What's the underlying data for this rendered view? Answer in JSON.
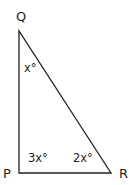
{
  "diagram": {
    "type": "right-triangle",
    "vertices": [
      {
        "name": "Q",
        "x": 19,
        "y": 31
      },
      {
        "name": "P",
        "x": 19,
        "y": 173
      },
      {
        "name": "R",
        "x": 111,
        "y": 173
      }
    ],
    "vertex_labels": {
      "Q": "Q",
      "P": "P",
      "R": "R"
    },
    "angle_labels": {
      "Q": "x°",
      "P": "3x°",
      "R": "2x°"
    },
    "stroke_color": "#231f20"
  }
}
